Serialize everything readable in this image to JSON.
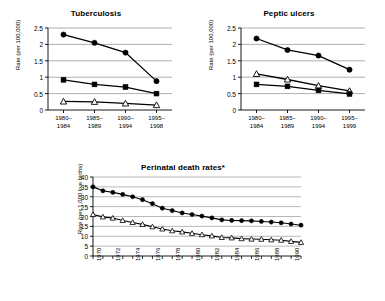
{
  "figure": {
    "panels": [
      "tuberculosis",
      "peptic_ulcers",
      "perinatal"
    ]
  },
  "chart_data": [
    {
      "id": "tuberculosis",
      "type": "line",
      "title": "Tuberculosis",
      "xlabel": "",
      "ylabel": "Rate (per 100,000)",
      "categories": [
        "1980–1984",
        "1985–1989",
        "1990–1994",
        "1995–1998"
      ],
      "category_lines": [
        [
          "1980–",
          "1984"
        ],
        [
          "1985–",
          "1989"
        ],
        [
          "1990–",
          "1994"
        ],
        [
          "1995–",
          "1998"
        ]
      ],
      "ylim": [
        0,
        2.5
      ],
      "yticks": [
        0,
        0.5,
        1,
        1.5,
        2,
        2.5
      ],
      "ytick_labels": [
        "0",
        "0.5",
        "1",
        "1.5",
        "2",
        "2.5"
      ],
      "grid": true,
      "legend": "none",
      "series": [
        {
          "name": "filled-circle",
          "marker": "circle",
          "values": [
            2.3,
            2.05,
            1.75,
            0.88
          ]
        },
        {
          "name": "filled-square",
          "marker": "square",
          "values": [
            0.92,
            0.78,
            0.7,
            0.5
          ]
        },
        {
          "name": "open-triangle",
          "marker": "triangle",
          "values": [
            0.26,
            0.25,
            0.2,
            0.15
          ]
        }
      ]
    },
    {
      "id": "peptic_ulcers",
      "type": "line",
      "title": "Peptic ulcers",
      "xlabel": "",
      "ylabel": "Rate (per 100,000)",
      "categories": [
        "1980–1984",
        "1985–1989",
        "1990–1994",
        "1995–1999"
      ],
      "category_lines": [
        [
          "1980–",
          "1984"
        ],
        [
          "1985–",
          "1989"
        ],
        [
          "1990–",
          "1994"
        ],
        [
          "1995–",
          "1999"
        ]
      ],
      "ylim": [
        0,
        2.5
      ],
      "yticks": [
        0,
        0.5,
        1,
        1.5,
        2,
        2.5
      ],
      "ytick_labels": [
        "0",
        "0.5",
        "1",
        "1.5",
        "2",
        "2.5"
      ],
      "grid": true,
      "legend": "none",
      "series": [
        {
          "name": "filled-circle",
          "marker": "circle",
          "values": [
            2.18,
            1.83,
            1.66,
            1.23
          ]
        },
        {
          "name": "open-triangle",
          "marker": "triangle",
          "values": [
            1.1,
            0.93,
            0.74,
            0.58
          ]
        },
        {
          "name": "filled-square",
          "marker": "square",
          "values": [
            0.78,
            0.72,
            0.6,
            0.49
          ]
        }
      ]
    },
    {
      "id": "perinatal",
      "type": "line",
      "title": "Perinatal death rates*",
      "xlabel": "",
      "ylabel": "Rate (per 1,000 live births)",
      "ylim": [
        0,
        40
      ],
      "yticks": [
        0,
        5,
        10,
        15,
        20,
        25,
        30,
        35,
        40
      ],
      "ytick_labels": [
        "0",
        "5",
        "10",
        "15",
        "20",
        "25",
        "30",
        "35",
        "40"
      ],
      "grid": true,
      "legend": "none",
      "x": [
        1970,
        1971,
        1972,
        1973,
        1974,
        1975,
        1976,
        1977,
        1978,
        1979,
        1980,
        1981,
        1982,
        1983,
        1984,
        1985,
        1986,
        1987,
        1988,
        1989,
        1990,
        1991
      ],
      "xtick_labels": [
        "1970",
        "",
        "1972",
        "",
        "1974",
        "",
        "1976",
        "",
        "1978",
        "",
        "1980",
        "",
        "1982",
        "",
        "1984",
        "",
        "1986",
        "",
        "1988",
        "",
        "1990",
        ""
      ],
      "series": [
        {
          "name": "filled-circle",
          "marker": "circle",
          "values": [
            35.0,
            33.0,
            32.2,
            31.2,
            30.0,
            28.5,
            26.5,
            24.2,
            23.0,
            21.8,
            21.0,
            20.2,
            19.3,
            18.3,
            18.0,
            17.9,
            17.8,
            17.5,
            17.2,
            16.8,
            16.2,
            15.6
          ]
        },
        {
          "name": "open-triangle",
          "marker": "triangle",
          "values": [
            21.0,
            19.8,
            19.2,
            18.0,
            17.0,
            16.0,
            14.8,
            13.7,
            12.8,
            12.2,
            11.5,
            10.8,
            10.2,
            9.4,
            9.2,
            8.8,
            8.6,
            8.5,
            8.2,
            8.0,
            7.4,
            6.9
          ]
        }
      ]
    }
  ]
}
